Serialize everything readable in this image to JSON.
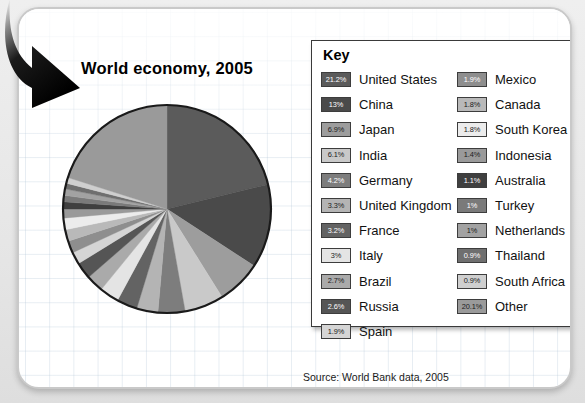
{
  "title": "World economy, 2005",
  "key": {
    "heading": "Key",
    "left_column": [
      {
        "percent": "21.2%",
        "label": "United States",
        "value": 21.2,
        "color": "#5b5b5b",
        "text_color": "#ffffff"
      },
      {
        "percent": "13%",
        "label": "China",
        "value": 13.0,
        "color": "#4a4a4a",
        "text_color": "#ffffff"
      },
      {
        "percent": "6.9%",
        "label": "Japan",
        "value": 6.9,
        "color": "#9d9d9d",
        "text_color": "#1a1a1a"
      },
      {
        "percent": "6.1%",
        "label": "India",
        "value": 6.1,
        "color": "#c9c9c9",
        "text_color": "#1a1a1a"
      },
      {
        "percent": "4.2%",
        "label": "Germany",
        "value": 4.2,
        "color": "#7d7d7d",
        "text_color": "#ffffff"
      },
      {
        "percent": "3.3%",
        "label": "United Kingdom",
        "value": 3.3,
        "color": "#b4b4b4",
        "text_color": "#1a1a1a"
      },
      {
        "percent": "3.2%",
        "label": "France",
        "value": 3.2,
        "color": "#636363",
        "text_color": "#ffffff"
      },
      {
        "percent": "3%",
        "label": "Italy",
        "value": 3.0,
        "color": "#e4e4e4",
        "text_color": "#1a1a1a"
      },
      {
        "percent": "2.7%",
        "label": "Brazil",
        "value": 2.7,
        "color": "#aaaaaa",
        "text_color": "#1a1a1a"
      },
      {
        "percent": "2.6%",
        "label": "Russia",
        "value": 2.6,
        "color": "#555555",
        "text_color": "#ffffff"
      },
      {
        "percent": "1.9%",
        "label": "Spain",
        "value": 1.9,
        "color": "#d5d5d5",
        "text_color": "#1a1a1a"
      }
    ],
    "right_column": [
      {
        "percent": "1.9%",
        "label": "Mexico",
        "value": 1.9,
        "color": "#8e8e8e",
        "text_color": "#ffffff"
      },
      {
        "percent": "1.8%",
        "label": "Canada",
        "value": 1.8,
        "color": "#b9b9b9",
        "text_color": "#1a1a1a"
      },
      {
        "percent": "1.8%",
        "label": "South Korea",
        "value": 1.8,
        "color": "#ececec",
        "text_color": "#1a1a1a"
      },
      {
        "percent": "1.4%",
        "label": "Indonesia",
        "value": 1.4,
        "color": "#9a9a9a",
        "text_color": "#1a1a1a"
      },
      {
        "percent": "1.1%",
        "label": "Australia",
        "value": 1.1,
        "color": "#3f3f3f",
        "text_color": "#ffffff"
      },
      {
        "percent": "1%",
        "label": "Turkey",
        "value": 1.0,
        "color": "#7a7a7a",
        "text_color": "#ffffff"
      },
      {
        "percent": "1%",
        "label": "Netherlands",
        "value": 1.0,
        "color": "#a2a2a2",
        "text_color": "#1a1a1a"
      },
      {
        "percent": "0.9%",
        "label": "Thailand",
        "value": 0.9,
        "color": "#6f6f6f",
        "text_color": "#ffffff"
      },
      {
        "percent": "0.9%",
        "label": "South Africa",
        "value": 0.9,
        "color": "#cfcfcf",
        "text_color": "#1a1a1a"
      },
      {
        "percent": "20.1%",
        "label": "Other",
        "value": 20.1,
        "color": "#9a9a9a",
        "text_color": "#1a1a1a"
      }
    ]
  },
  "source": "Source: World Bank data, 2005",
  "chart_data": {
    "type": "pie",
    "title": "World economy, 2005",
    "unit": "percent",
    "start_angle_deg": 0,
    "direction": "clockwise",
    "outline_color": "#1a1a1a",
    "categories": [
      "United States",
      "China",
      "Japan",
      "India",
      "Germany",
      "United Kingdom",
      "France",
      "Italy",
      "Brazil",
      "Russia",
      "Spain",
      "Mexico",
      "Canada",
      "South Korea",
      "Indonesia",
      "Australia",
      "Turkey",
      "Netherlands",
      "Thailand",
      "South Africa",
      "Other"
    ],
    "values": [
      21.2,
      13,
      6.9,
      6.1,
      4.2,
      3.3,
      3.2,
      3,
      2.7,
      2.6,
      1.9,
      1.9,
      1.8,
      1.8,
      1.4,
      1.1,
      1,
      1,
      0.9,
      0.9,
      20.1
    ],
    "colors": [
      "#5b5b5b",
      "#4a4a4a",
      "#9d9d9d",
      "#c9c9c9",
      "#7d7d7d",
      "#b4b4b4",
      "#636363",
      "#e4e4e4",
      "#aaaaaa",
      "#555555",
      "#d5d5d5",
      "#8e8e8e",
      "#b9b9b9",
      "#ececec",
      "#9a9a9a",
      "#3f3f3f",
      "#7a7a7a",
      "#a2a2a2",
      "#6f6f6f",
      "#cfcfcf",
      "#9a9a9a"
    ],
    "legend_position": "right",
    "grid": false
  }
}
